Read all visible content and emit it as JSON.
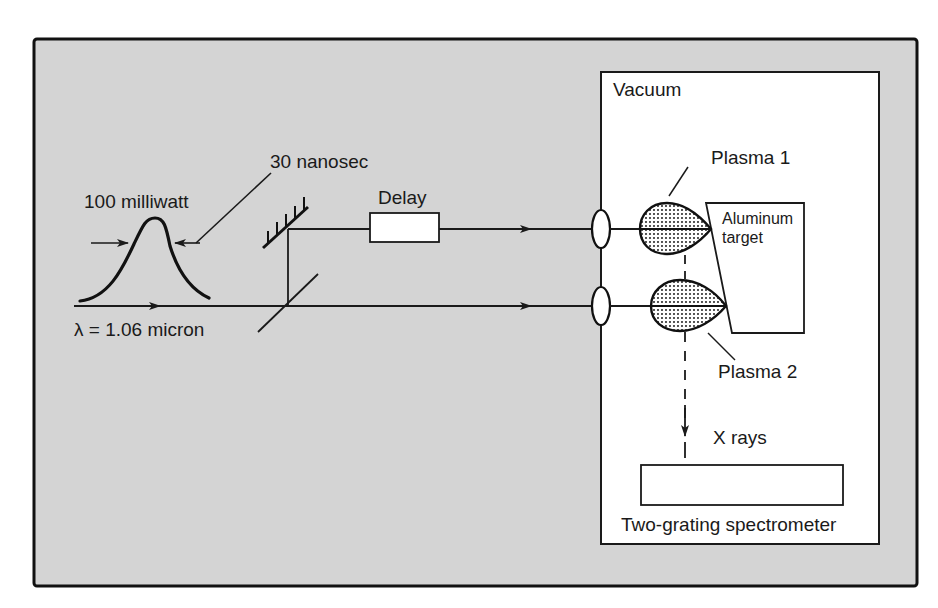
{
  "colors": {
    "panel_bg": "#d4d4d4",
    "vacuum_bg": "#ffffff",
    "ink": "#1a1a1a",
    "plasma_fill": "#c8c8c8"
  },
  "labels": {
    "pulse_power": "100 milliwatt",
    "pulse_width": "30 nanosec",
    "wavelength": "λ = 1.06 micron",
    "delay": "Delay",
    "vacuum": "Vacuum",
    "plasma1": "Plasma 1",
    "plasma2": "Plasma 2",
    "target_line1": "Aluminum",
    "target_line2": "target",
    "xrays": "X rays",
    "spectrometer": "Two-grating spectrometer"
  },
  "components": [
    {
      "id": "laser-pulse",
      "label": "100 milliwatt / 30 nanosec pulse"
    },
    {
      "id": "mirror",
      "label": "mirror"
    },
    {
      "id": "beam-splitter",
      "label": "beam splitter"
    },
    {
      "id": "delay-line",
      "label": "Delay"
    },
    {
      "id": "lens-1",
      "label": "lens"
    },
    {
      "id": "lens-2",
      "label": "lens"
    },
    {
      "id": "plasma-1",
      "label": "Plasma 1"
    },
    {
      "id": "plasma-2",
      "label": "Plasma 2"
    },
    {
      "id": "aluminum-target",
      "label": "Aluminum target"
    },
    {
      "id": "spectrometer",
      "label": "Two-grating spectrometer"
    }
  ]
}
